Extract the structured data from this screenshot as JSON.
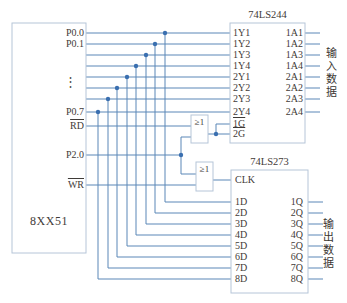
{
  "diagram": {
    "mcu": {
      "title": "8XX51",
      "ellipsis": "⋮",
      "pins": {
        "p00": "P0.0",
        "p01": "P0.1",
        "p07": "P0.7",
        "rd": "RD",
        "p20": "P2.0",
        "wr": "WR"
      }
    },
    "buffer244": {
      "title": "74LS244",
      "left_pins": [
        "1Y1",
        "1Y2",
        "1Y3",
        "1Y4",
        "2Y1",
        "2Y2",
        "2Y3",
        "2Y4"
      ],
      "enable_pins": [
        "1G",
        "2G"
      ],
      "right_pins": [
        "1A1",
        "1A2",
        "1A3",
        "1A4",
        "2A1",
        "2A2",
        "2A3",
        "2A4"
      ],
      "side_label": "输入数据"
    },
    "latch273": {
      "title": "74LS273",
      "clk_pin": "CLK",
      "left_pins": [
        "1D",
        "2D",
        "3D",
        "4D",
        "5D",
        "6D",
        "7D",
        "8D"
      ],
      "right_pins": [
        "1Q",
        "2Q",
        "3Q",
        "4Q",
        "5Q",
        "6Q",
        "7Q",
        "8Q"
      ],
      "side_label": "输出数据"
    },
    "gates": {
      "or1": "≥1",
      "or2": "≥1"
    },
    "colors": {
      "wire": "#5b87b7",
      "box_border": "#b6c5d8",
      "junction_dot": "#3a6fb0",
      "text": "#3f3b38"
    }
  }
}
